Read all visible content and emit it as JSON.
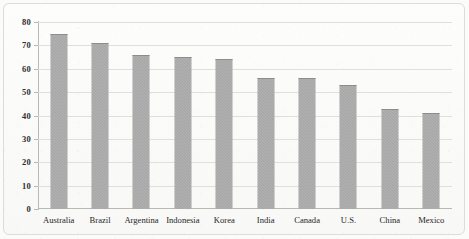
{
  "chart_data": {
    "type": "bar",
    "title": "",
    "subtitle": "",
    "xlabel": "",
    "ylabel": "",
    "ylim": [
      0,
      80
    ],
    "yticks": [
      0,
      10,
      20,
      30,
      40,
      50,
      60,
      70,
      80
    ],
    "grid": true,
    "legend": false,
    "legend_position": "none",
    "categories": [
      "Australia",
      "Brazil",
      "Argentina",
      "Indonesia",
      "Korea",
      "India",
      "Canada",
      "U.S.",
      "China",
      "Mexico"
    ],
    "values": [
      75,
      71,
      66,
      65,
      64,
      56,
      56,
      53,
      43,
      41
    ],
    "series": [
      {
        "name": "",
        "values": [
          75,
          71,
          66,
          65,
          64,
          56,
          56,
          53,
          43,
          41
        ]
      }
    ],
    "colors": {
      "bar_fill": "#9d9d9d",
      "gridline": "#dfdfdb",
      "axis": "#b9b9b4",
      "background": "#fbfbfa",
      "frame_border": "#dcdcd8",
      "tick_text": "#2e2e2e"
    }
  }
}
